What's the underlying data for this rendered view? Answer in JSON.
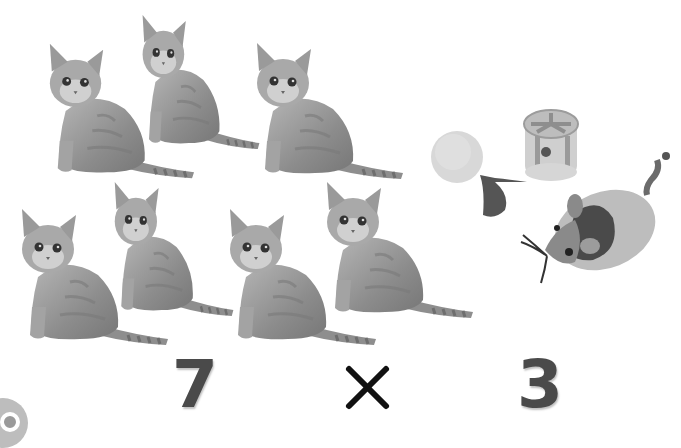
{
  "scene": {
    "description": "Multiplication illustration: kittens and cat toys",
    "background": "#ffffff"
  },
  "kittens": {
    "count": 7,
    "items": [
      {
        "label": "kitten-1",
        "row": 1
      },
      {
        "label": "kitten-2",
        "row": 1
      },
      {
        "label": "kitten-3",
        "row": 1
      },
      {
        "label": "kitten-4",
        "row": 2
      },
      {
        "label": "kitten-5",
        "row": 2
      },
      {
        "label": "kitten-6",
        "row": 2
      },
      {
        "label": "kitten-7",
        "row": 2
      }
    ]
  },
  "toys": {
    "count": 3,
    "items": [
      {
        "label": "pom-pom-ball-with-feather"
      },
      {
        "label": "rattle-wheel-toy"
      },
      {
        "label": "toy-mouse"
      }
    ]
  },
  "equation": {
    "left": "7",
    "operator": "×",
    "right": "3",
    "text_color": "#4a4a4a",
    "operator_color": "#111111"
  }
}
